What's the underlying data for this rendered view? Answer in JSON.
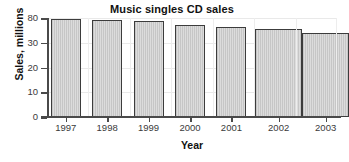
{
  "chart_data": {
    "type": "bar",
    "title": "Music singles CD sales",
    "xlabel": "Year",
    "ylabel": "Sales, millions",
    "categories": [
      "1997",
      "1998",
      "1999",
      "2000",
      "2001",
      "2002",
      "2003"
    ],
    "values": [
      78,
      76,
      74,
      66,
      62,
      57,
      50
    ],
    "ytick_labels": [
      "0",
      "10",
      "20",
      "30",
      "80"
    ],
    "ytick_values": [
      0,
      10,
      20,
      30,
      80
    ],
    "ylim": [
      0,
      80
    ],
    "grid": true,
    "legend": "none",
    "series": [
      {
        "name": "Music singles CD sales",
        "values": [
          78,
          76,
          74,
          66,
          62,
          57,
          50
        ]
      }
    ],
    "bar_color": "#d2d2d2",
    "bar_edge_color": "#3c3c3c",
    "axis_color": "#4a4a4a",
    "grid_color": "#e9e9e9"
  }
}
